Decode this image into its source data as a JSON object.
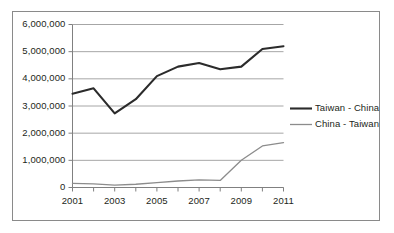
{
  "chart_data": {
    "type": "line",
    "title": "",
    "subtitle": "",
    "xlabel": "",
    "ylabel": "",
    "x": [
      2001,
      2002,
      2003,
      2004,
      2005,
      2006,
      2007,
      2008,
      2009,
      2010,
      2011
    ],
    "xtick_labels": [
      "2001",
      "2003",
      "2005",
      "2007",
      "2009",
      "2011"
    ],
    "xtick_values": [
      2001,
      2003,
      2005,
      2007,
      2009,
      2011
    ],
    "ytick_labels": [
      "0",
      "1,000,000",
      "2,000,000",
      "3,000,000",
      "4,000,000",
      "5,000,000",
      "6,000,000"
    ],
    "ytick_values": [
      0,
      1000000,
      2000000,
      3000000,
      4000000,
      5000000,
      6000000
    ],
    "ylim": [
      0,
      6000000
    ],
    "xlim": [
      2001,
      2011
    ],
    "grid": "horizontal",
    "legend_position": "right",
    "series": [
      {
        "name": "Taiwan - China",
        "color": "#2b2b2b",
        "width": 2.1,
        "values": [
          3450000,
          3650000,
          2730000,
          3250000,
          4100000,
          4450000,
          4580000,
          4350000,
          4450000,
          5100000,
          5200000
        ]
      },
      {
        "name": "China - Taiwan",
        "color": "#8c8c8c",
        "width": 1.3,
        "values": [
          150000,
          130000,
          90000,
          120000,
          180000,
          240000,
          280000,
          260000,
          1000000,
          1530000,
          1650000
        ]
      }
    ],
    "colors": {
      "gridline": "#a6a6a6",
      "axis": "#808080",
      "text": "#231f20",
      "frame": "#8a8a8a",
      "background": "#ffffff"
    }
  },
  "figure": {
    "frame_label": "chart-frame"
  }
}
